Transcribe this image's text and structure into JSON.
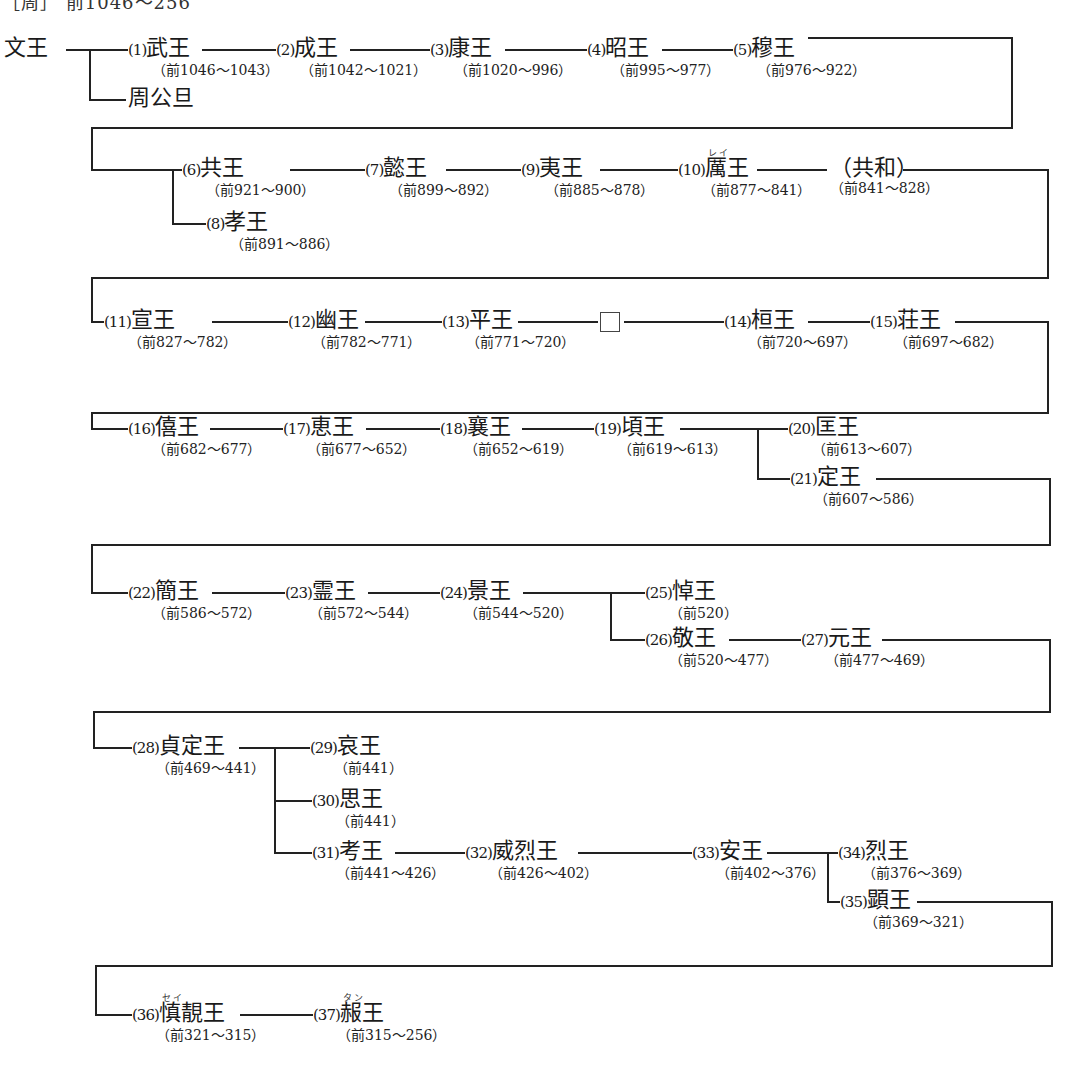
{
  "clipped_title": "［周］ 前1046〜256",
  "root": {
    "name": "文王"
  },
  "sibling": {
    "name": "周公旦"
  },
  "kings": [
    {
      "num": "(1)",
      "name": "武王",
      "dates": "（前1046〜1043）"
    },
    {
      "num": "(2)",
      "name": "成王",
      "dates": "（前1042〜1021）"
    },
    {
      "num": "(3)",
      "name": "康王",
      "dates": "（前1020〜996）"
    },
    {
      "num": "(4)",
      "name": "昭王",
      "dates": "（前995〜977）"
    },
    {
      "num": "(5)",
      "name": "穆王",
      "dates": "（前976〜922）"
    },
    {
      "num": "(6)",
      "name": "共王",
      "dates": "（前921〜900）"
    },
    {
      "num": "(7)",
      "name": "懿王",
      "dates": "（前899〜892）"
    },
    {
      "num": "(8)",
      "name": "孝王",
      "dates": "（前891〜886）"
    },
    {
      "num": "(9)",
      "name": "夷王",
      "dates": "（前885〜878）"
    },
    {
      "num": "(10)",
      "name": "厲王",
      "dates": "（前877〜841）",
      "ruby": "レイ"
    },
    {
      "num": "(11)",
      "name": "宣王",
      "dates": "（前827〜782）"
    },
    {
      "num": "(12)",
      "name": "幽王",
      "dates": "（前782〜771）"
    },
    {
      "num": "(13)",
      "name": "平王",
      "dates": "（前771〜720）"
    },
    {
      "num": "(14)",
      "name": "桓王",
      "dates": "（前720〜697）"
    },
    {
      "num": "(15)",
      "name": "荘王",
      "dates": "（前697〜682）"
    },
    {
      "num": "(16)",
      "name": "僖王",
      "dates": "（前682〜677）"
    },
    {
      "num": "(17)",
      "name": "恵王",
      "dates": "（前677〜652）"
    },
    {
      "num": "(18)",
      "name": "襄王",
      "dates": "（前652〜619）"
    },
    {
      "num": "(19)",
      "name": "頃王",
      "dates": "（前619〜613）"
    },
    {
      "num": "(20)",
      "name": "匡王",
      "dates": "（前613〜607）"
    },
    {
      "num": "(21)",
      "name": "定王",
      "dates": "（前607〜586）"
    },
    {
      "num": "(22)",
      "name": "簡王",
      "dates": "（前586〜572）"
    },
    {
      "num": "(23)",
      "name": "霊王",
      "dates": "（前572〜544）"
    },
    {
      "num": "(24)",
      "name": "景王",
      "dates": "（前544〜520）"
    },
    {
      "num": "(25)",
      "name": "悼王",
      "dates": "（前520）"
    },
    {
      "num": "(26)",
      "name": "敬王",
      "dates": "（前520〜477）"
    },
    {
      "num": "(27)",
      "name": "元王",
      "dates": "（前477〜469）"
    },
    {
      "num": "(28)",
      "name": "貞定王",
      "dates": "（前469〜441）"
    },
    {
      "num": "(29)",
      "name": "哀王",
      "dates": "（前441）"
    },
    {
      "num": "(30)",
      "name": "思王",
      "dates": "（前441）"
    },
    {
      "num": "(31)",
      "name": "考王",
      "dates": "（前441〜426）"
    },
    {
      "num": "(32)",
      "name": "威烈王",
      "dates": "（前426〜402）"
    },
    {
      "num": "(33)",
      "name": "安王",
      "dates": "（前402〜376）"
    },
    {
      "num": "(34)",
      "name": "烈王",
      "dates": "（前376〜369）"
    },
    {
      "num": "(35)",
      "name": "顕王",
      "dates": "（前369〜321）"
    },
    {
      "num": "(36)",
      "name": "慎靚王",
      "dates": "（前321〜315）",
      "ruby": "セイ"
    },
    {
      "num": "(37)",
      "name": "赧王",
      "dates": "（前315〜256）",
      "ruby": "タン"
    }
  ],
  "regency": {
    "name": "（共和）",
    "dates": "（前841〜828）"
  },
  "unknown_box": {
    "label": "□"
  }
}
